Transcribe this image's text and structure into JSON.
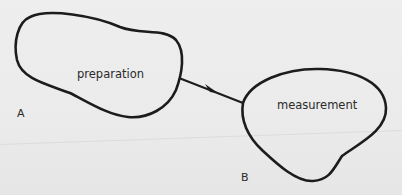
{
  "diagram": {
    "nodes": [
      {
        "id": "preparation",
        "label": "preparation"
      },
      {
        "id": "measurement",
        "label": "measurement"
      }
    ],
    "edges": [
      {
        "from": "preparation",
        "to": "measurement",
        "directed": true
      }
    ],
    "point_labels": {
      "a": "A",
      "b": "B"
    }
  },
  "colors": {
    "stroke": "#1c1c1c",
    "background": "#ececec",
    "text": "#2a2a2a"
  }
}
